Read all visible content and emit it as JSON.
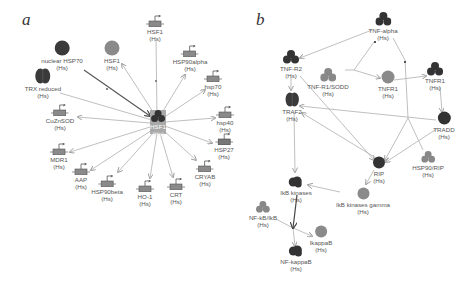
{
  "panel_a": {
    "label": "a",
    "hub": {
      "name": "HSF1",
      "species": "(Hs)",
      "x": 158,
      "y": 120
    },
    "nodes": [
      {
        "id": "nuclear_hsp70",
        "name": "nuclear HSP70",
        "species": "(Hs)",
        "type": "protein-dark",
        "x": 62,
        "y": 48
      },
      {
        "id": "hsf1_protein",
        "name": "HSF1",
        "species": "(Hs)",
        "type": "protein-gray",
        "x": 112,
        "y": 48
      },
      {
        "id": "hsf1_gene",
        "name": "HSF1",
        "species": "(Hs)",
        "type": "gene",
        "x": 155,
        "y": 28
      },
      {
        "id": "hsp90alpha",
        "name": "HSP90alpha",
        "species": "(Hs)",
        "type": "gene",
        "x": 190,
        "y": 58
      },
      {
        "id": "hsp70_gene",
        "name": "hsp70",
        "species": "(Hs)",
        "type": "gene",
        "x": 213,
        "y": 80
      },
      {
        "id": "trx_reduced",
        "name": "TRX reduced",
        "species": "(Hs)",
        "type": "protein-dimer",
        "x": 43,
        "y": 80
      },
      {
        "id": "cuznsod",
        "name": "CuZnSOD",
        "species": "(Hs)",
        "type": "gene",
        "x": 60,
        "y": 115
      },
      {
        "id": "hsp40",
        "name": "hsp40",
        "species": "(Hs)",
        "type": "gene",
        "x": 225,
        "y": 116
      },
      {
        "id": "hsp27",
        "name": "HSP27",
        "species": "(Hs)",
        "type": "gene",
        "x": 224,
        "y": 142
      },
      {
        "id": "mdr1",
        "name": "MDR1",
        "species": "(Hs)",
        "type": "gene",
        "x": 59,
        "y": 150
      },
      {
        "id": "cryab",
        "name": "CRYAB",
        "species": "(Hs)",
        "type": "gene",
        "x": 205,
        "y": 170
      },
      {
        "id": "aap",
        "name": "AAP",
        "species": "(Hs)",
        "type": "gene",
        "x": 81,
        "y": 170
      },
      {
        "id": "hsp90beta",
        "name": "HSP90beta",
        "species": "(Hs)",
        "type": "gene",
        "x": 107,
        "y": 183
      },
      {
        "id": "ho1",
        "name": "HO-1",
        "species": "(Hs)",
        "type": "gene",
        "x": 145,
        "y": 188
      },
      {
        "id": "crt",
        "name": "CRT",
        "species": "(Hs)",
        "type": "gene",
        "x": 176,
        "y": 187
      }
    ]
  },
  "panel_b": {
    "label": "b",
    "nodes": [
      {
        "id": "tnf_alpha",
        "name": "TNF-alpha",
        "species": "(Hs)",
        "type": "complex-dark",
        "x": 383,
        "y": 22
      },
      {
        "id": "tnf_r2",
        "name": "TNF-R2",
        "species": "(Hs)",
        "type": "complex-dark",
        "x": 291,
        "y": 62
      },
      {
        "id": "tnfr1_sodd",
        "name": "TNF-R1/SODD",
        "species": "(Hs)",
        "type": "complex-gray",
        "x": 328,
        "y": 73
      },
      {
        "id": "tnfr1_protein",
        "name": "TNFR1",
        "species": "(Hs)",
        "type": "protein-gray",
        "x": 388,
        "y": 80
      },
      {
        "id": "tnfr1_complex",
        "name": "TNFR1",
        "species": "(Hs)",
        "type": "complex-dark",
        "x": 435,
        "y": 72
      },
      {
        "id": "traf2",
        "name": "TRAF2",
        "species": "(Hs)",
        "type": "protein-dimer",
        "x": 292,
        "y": 100
      },
      {
        "id": "tradd",
        "name": "TRADD",
        "species": "(Hs)",
        "type": "protein-dark",
        "x": 444,
        "y": 120
      },
      {
        "id": "rip",
        "name": "RIP",
        "species": "(Hs)",
        "type": "protein-dark",
        "x": 379,
        "y": 163
      },
      {
        "id": "hsp90_rip",
        "name": "HSP90/RIP",
        "species": "(Hs)",
        "type": "complex-gray",
        "x": 428,
        "y": 160
      },
      {
        "id": "ikb_kinases",
        "name": "IkB kinases",
        "species": "(Hs)",
        "type": "protein-cluster",
        "x": 296,
        "y": 183
      },
      {
        "id": "ikb_kinase_gamma",
        "name": "IkB kinases gamma",
        "species": "(Hs)",
        "type": "protein-gray",
        "x": 363,
        "y": 192
      },
      {
        "id": "nf_kb_ikb",
        "name": "NF-kB/IkB",
        "species": "(Hs)",
        "type": "complex-gray",
        "x": 263,
        "y": 210
      },
      {
        "id": "ikappab",
        "name": "IkappaB",
        "species": "(Hs)",
        "type": "protein-gray",
        "x": 321,
        "y": 236
      },
      {
        "id": "nf_kappab",
        "name": "NF-kappaB",
        "species": "(Hs)",
        "type": "protein-cluster",
        "x": 296,
        "y": 254
      }
    ]
  }
}
